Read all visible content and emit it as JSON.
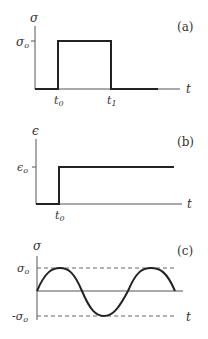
{
  "panels": [
    {
      "id": "a",
      "label": "(a)",
      "y_axis_label": "σ",
      "x_axis_label": "t",
      "level_label": "σ",
      "level_sub": "o",
      "ticks": [
        {
          "main": "t",
          "sub": "0"
        },
        {
          "main": "t",
          "sub": "1"
        }
      ],
      "description": "Rectangular stress pulse of amplitude σo applied from t0 to t1"
    },
    {
      "id": "b",
      "label": "(b)",
      "y_axis_label": "ϵ",
      "x_axis_label": "t",
      "level_label": "ϵ",
      "level_sub": "o",
      "ticks": [
        {
          "main": "t",
          "sub": "0"
        }
      ],
      "description": "Step strain of amplitude ϵo applied at t0"
    },
    {
      "id": "c",
      "label": "(c)",
      "y_axis_label": "σ",
      "x_axis_label": "t",
      "level_label": "σ",
      "level_sub": "o",
      "neg_level_label": "-σ",
      "neg_level_sub": "o",
      "description": "Sinusoidal stress oscillating between σo and -σo"
    }
  ],
  "colors": {
    "axis": "#555555",
    "curve": "#222222",
    "dashed": "#666666"
  }
}
